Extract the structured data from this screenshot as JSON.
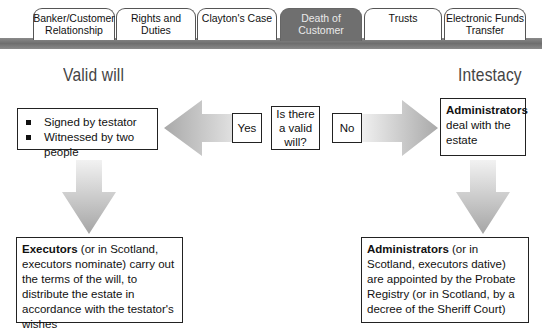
{
  "tabs": [
    {
      "label": "Banker/Customer Relationship",
      "active": false
    },
    {
      "label": "Rights and Duties",
      "active": false
    },
    {
      "label": "Clayton's Case",
      "active": false
    },
    {
      "label": "Death of Customer",
      "active": true
    },
    {
      "label": "Trusts",
      "active": false
    },
    {
      "label": "Electronic Funds Transfer",
      "active": false
    }
  ],
  "left": {
    "heading": "Valid will",
    "requirements": [
      "Signed by testator",
      "Witnessed by two people"
    ],
    "outcome": {
      "bold": "Executors",
      "text": " (or in Scotland, executors nominate) carry out the terms of the will, to distribute the estate in accordance with the testator's wishes"
    }
  },
  "center": {
    "question": "Is there a valid will?",
    "yes_label": "Yes",
    "no_label": "No"
  },
  "right": {
    "heading": "Intestacy",
    "summary": {
      "bold": "Administrators",
      "text": " deal with the estate"
    },
    "outcome": {
      "bold": "Administrators",
      "text": " (or in Scotland, executors dative) are appointed by the Probate Registry (or in Scotland, by a decree of the Sheriff Court)"
    }
  },
  "colors": {
    "tab_bar": "#7a7a7a",
    "active_tab": "#6f6f6f",
    "arrow_light": "#ececec",
    "arrow_dark": "#a8a8a8"
  }
}
